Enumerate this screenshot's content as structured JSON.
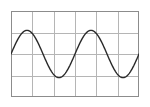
{
  "figure": {
    "name": "sine-wave-grid-plot",
    "background_color": "#ffffff",
    "border_color": "#8c8c8c",
    "gridline_color": "#b5b5b5",
    "curve_color": "#2b2b2b",
    "curve_width": 1.4,
    "border_width": 1,
    "gridline_width": 1,
    "plot_left": 11,
    "plot_top": 11,
    "plot_width": 128,
    "plot_height": 86
  },
  "chart_data": {
    "type": "line",
    "title": "",
    "subtitle": "",
    "xlabel": "",
    "ylabel": "",
    "xlim": [
      0,
      6
    ],
    "ylim": [
      0,
      4
    ],
    "grid": true,
    "grid_columns": 6,
    "grid_rows": 4,
    "legend": false,
    "legend_position": "none",
    "xticks": [
      0,
      1,
      2,
      3,
      4,
      5,
      6
    ],
    "yticks": [
      0,
      1,
      2,
      3,
      4
    ],
    "xtick_labels": [
      "",
      "",
      "",
      "",
      "",
      "",
      ""
    ],
    "ytick_labels": [
      "",
      "",
      "",
      "",
      ""
    ],
    "annotations": [],
    "series": [
      {
        "name": "sine",
        "function": "y = 2 + 1.1 * sin(2*pi*x/3)",
        "amplitude": 1.1,
        "period": 3,
        "midline": 2,
        "phase": 0,
        "cycles": 2,
        "x": [
          0,
          0.15,
          0.3,
          0.45,
          0.6,
          0.75,
          0.9,
          1.05,
          1.2,
          1.35,
          1.5,
          1.65,
          1.8,
          1.95,
          2.1,
          2.25,
          2.4,
          2.55,
          2.7,
          2.85,
          3.0,
          3.15,
          3.3,
          3.45,
          3.6,
          3.75,
          3.9,
          4.05,
          4.2,
          4.35,
          4.5,
          4.65,
          4.8,
          4.95,
          5.1,
          5.25,
          5.4,
          5.55,
          5.7,
          5.85,
          6.0
        ],
        "y": [
          2.0,
          2.34,
          2.65,
          2.89,
          3.05,
          3.1,
          3.05,
          2.89,
          2.65,
          2.34,
          2.0,
          1.66,
          1.35,
          1.11,
          0.95,
          0.9,
          0.95,
          1.11,
          1.35,
          1.66,
          2.0,
          2.34,
          2.65,
          2.89,
          3.05,
          3.1,
          3.05,
          2.89,
          2.65,
          2.34,
          2.0,
          1.66,
          1.35,
          1.11,
          0.95,
          0.9,
          0.95,
          1.11,
          1.35,
          1.66,
          2.0
        ],
        "peaks": [
          {
            "x": 0.75,
            "y": 3.1
          },
          {
            "x": 3.75,
            "y": 3.1
          }
        ],
        "troughs": [
          {
            "x": 2.25,
            "y": 0.9
          },
          {
            "x": 5.25,
            "y": 0.9
          }
        ],
        "zero_crossings": [
          0,
          1.5,
          3.0,
          4.5,
          6.0
        ]
      }
    ]
  }
}
